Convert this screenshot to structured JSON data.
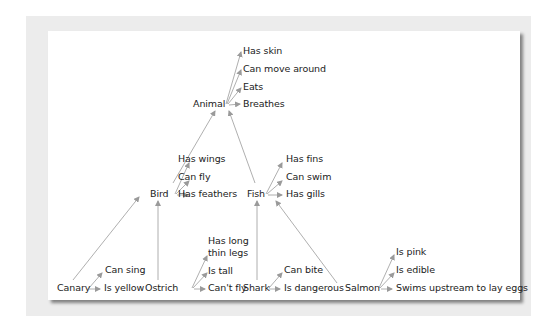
{
  "diagram": {
    "type": "semantic-network-hierarchy",
    "colors": {
      "line": "#9a9a9a",
      "text": "#222222",
      "panel": "#ececec",
      "card": "#ffffff"
    },
    "nodes": {
      "animal": {
        "label": "Animal",
        "properties": [
          "Has skin",
          "Can move around",
          "Eats",
          "Breathes"
        ]
      },
      "bird": {
        "label": "Bird",
        "properties": [
          "Has wings",
          "Can fly",
          "Has feathers"
        ]
      },
      "fish": {
        "label": "Fish",
        "properties": [
          "Has fins",
          "Can swim",
          "Has gills"
        ]
      },
      "canary": {
        "label": "Canary",
        "properties": [
          "Can sing",
          "Is yellow"
        ]
      },
      "ostrich": {
        "label": "Ostrich",
        "properties": [
          "Has long",
          "thin legs",
          "Is tall",
          "Can't fly"
        ]
      },
      "shark": {
        "label": "Shark",
        "properties": [
          "Can bite",
          "Is dangerous"
        ]
      },
      "salmon": {
        "label": "Salmon",
        "properties": [
          "Is pink",
          "Is edible",
          "Swims upstream to lay eggs"
        ]
      }
    },
    "edges": [
      [
        "bird",
        "animal"
      ],
      [
        "fish",
        "animal"
      ],
      [
        "canary",
        "bird"
      ],
      [
        "ostrich",
        "bird"
      ],
      [
        "shark",
        "fish"
      ],
      [
        "salmon",
        "fish"
      ]
    ]
  }
}
